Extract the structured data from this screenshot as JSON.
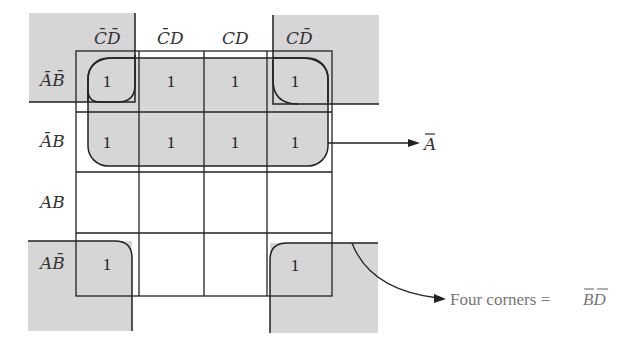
{
  "kmap": {
    "column_headers": [
      {
        "label": "CD",
        "overbar": [
          0,
          1
        ]
      },
      {
        "label": "CD",
        "overbar": [
          0
        ]
      },
      {
        "label": "CD",
        "overbar": []
      },
      {
        "label": "CD",
        "overbar": [
          1
        ]
      }
    ],
    "column_header_text": [
      "C̄D̄",
      "C̄D",
      "CD",
      "CD̄"
    ],
    "row_headers": [
      {
        "label": "AB",
        "overbar": [
          0,
          1
        ]
      },
      {
        "label": "AB",
        "overbar": [
          0
        ]
      },
      {
        "label": "AB",
        "overbar": []
      },
      {
        "label": "AB",
        "overbar": [
          1
        ]
      }
    ],
    "row_header_text": [
      "ĀB̄",
      "ĀB",
      "AB",
      "AB̄"
    ],
    "cells": [
      [
        "1",
        "1",
        "1",
        "1"
      ],
      [
        "1",
        "1",
        "1",
        "1"
      ],
      [
        "",
        "",
        "",
        ""
      ],
      [
        "1",
        "",
        "",
        "1"
      ]
    ],
    "groups": [
      {
        "name": "A-bar group",
        "rows": [
          0,
          1
        ],
        "cols": [
          0,
          1,
          2,
          3
        ],
        "term": "Ā"
      },
      {
        "name": "Four corners",
        "rows": [
          0,
          3
        ],
        "cols": [
          0,
          3
        ],
        "term": "B̄D̄"
      }
    ]
  },
  "annotations": {
    "a_bar": "A",
    "four_corners_prefix": "Four corners = ",
    "four_corners_term": "BD"
  },
  "colors": {
    "shade": "#d6d6d6",
    "line": "#222222",
    "note_text": "#777777"
  }
}
